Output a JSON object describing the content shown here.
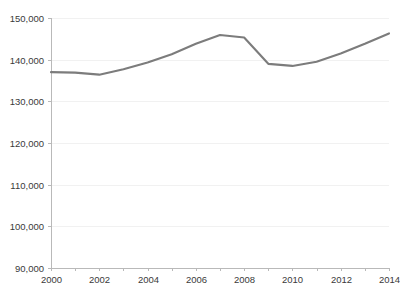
{
  "chart_data": {
    "type": "line",
    "title": "",
    "subtitle": "",
    "xlabel": "",
    "ylabel": "",
    "x": [
      2000,
      2001,
      2002,
      2003,
      2004,
      2005,
      2006,
      2007,
      2008,
      2009,
      2010,
      2011,
      2012,
      2013,
      2014
    ],
    "series": [
      {
        "name": "",
        "values": [
          137000,
          136900,
          136400,
          137700,
          139300,
          141300,
          143800,
          145900,
          145300,
          139000,
          138500,
          139500,
          141500,
          143800,
          146300
        ],
        "color": "#7c7c7c"
      }
    ],
    "xlim": [
      2000,
      2014
    ],
    "ylim": [
      90000,
      150000
    ],
    "y_ticks": [
      90000,
      100000,
      110000,
      120000,
      130000,
      140000,
      150000
    ],
    "y_tick_labels": [
      "90,000",
      "100,000",
      "110,000",
      "120,000",
      "130,000",
      "140,000",
      "150,000"
    ],
    "x_ticks": [
      2000,
      2001,
      2002,
      2003,
      2004,
      2005,
      2006,
      2007,
      2008,
      2009,
      2010,
      2011,
      2012,
      2013,
      2014
    ],
    "x_tick_labels_shown": [
      "2000",
      "2002",
      "2004",
      "2006",
      "2008",
      "2010",
      "2012",
      "2014"
    ],
    "grid": true,
    "grid_axis": "y",
    "legend": false,
    "legend_position": "none",
    "background_color": "#ffffff",
    "grid_color": "#f1f1f1",
    "axis_color": "#b9b9b9",
    "tick_label_color": "#3a3a3a"
  },
  "plot_geometry": {
    "left": 51,
    "right": 389,
    "top": 18,
    "bottom": 268
  }
}
